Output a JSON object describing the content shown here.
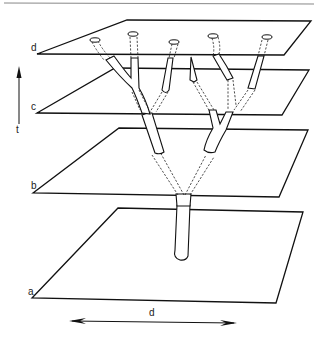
{
  "figure": {
    "type": "stacked time-planes with branching lineage tree",
    "planes": [
      {
        "id": "d",
        "label": "d"
      },
      {
        "id": "c",
        "label": "c"
      },
      {
        "id": "b",
        "label": "b"
      },
      {
        "id": "a",
        "label": "a"
      }
    ],
    "time_axis": {
      "label": "t",
      "direction": "up"
    },
    "space_axis": {
      "label": "d",
      "direction": "bidirectional"
    },
    "tree": {
      "root_plane": "a",
      "tips_at_top_plane": 5,
      "description": "Single trunk rising from plane a splits into two branches; each continues to sub-divide toward plane d. Solid segments show visible stems near planes, dashed segments show the portions hidden between planes."
    }
  }
}
